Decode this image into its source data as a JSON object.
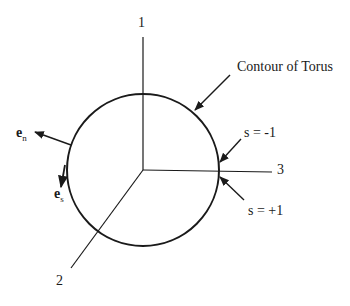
{
  "diagram": {
    "axes": [
      {
        "id": "1",
        "label": "1"
      },
      {
        "id": "2",
        "label": "2"
      },
      {
        "id": "3",
        "label": "3"
      }
    ],
    "contour_label": "Contour of Torus",
    "s_minus": "s = -1",
    "s_plus": "s = +1",
    "vector_n": {
      "base": "e",
      "sub": "n"
    },
    "vector_s": {
      "base": "e",
      "sub": "s"
    },
    "colors": {
      "line": "#1a1a1a",
      "background": "#ffffff"
    }
  }
}
